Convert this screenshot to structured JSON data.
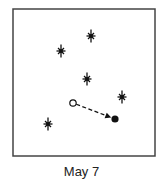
{
  "figure": {
    "caption": "May 7",
    "frame": {
      "x": 13,
      "y": 9,
      "width": 142,
      "height": 147,
      "stroke": "#444444"
    },
    "stars": [
      {
        "x": 91,
        "y": 36
      },
      {
        "x": 61,
        "y": 51
      },
      {
        "x": 87,
        "y": 79
      },
      {
        "x": 122,
        "y": 97
      },
      {
        "x": 48,
        "y": 124
      }
    ],
    "moving_object": {
      "start": {
        "x": 73,
        "y": 103,
        "style": "open-circle"
      },
      "end": {
        "x": 115,
        "y": 119,
        "style": "filled-circle"
      },
      "path": "dashed-arrow"
    },
    "colors": {
      "ink": "#111111",
      "frame": "#444444"
    }
  }
}
